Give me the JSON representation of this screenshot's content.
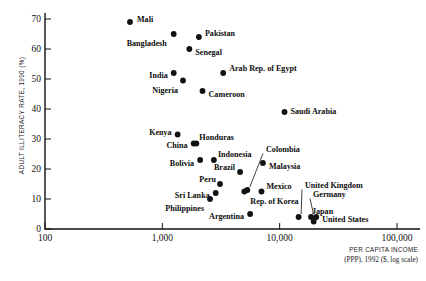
{
  "chart_data": {
    "type": "scatter",
    "title": "",
    "xlabel": "PER CAPITA INCOME",
    "xlabel2": "(PPP), 1992 ($, log scale)",
    "ylabel": "ADULT ILLITERACY RATE, 1990 (%)",
    "xscale": "log",
    "xlim": [
      100,
      100000
    ],
    "ylim": [
      0,
      72
    ],
    "grid": false,
    "legend": "none",
    "xticks": [
      100,
      1000,
      10000,
      100000
    ],
    "xtick_labels": [
      "100",
      "1,000",
      "10,000",
      "100,000"
    ],
    "yticks": [
      0,
      10,
      20,
      30,
      40,
      50,
      60,
      70
    ],
    "ytick_labels": [
      "0",
      "10",
      "20",
      "30",
      "40",
      "50",
      "60",
      "70"
    ],
    "points": [
      {
        "name": "Mali",
        "x": 530,
        "y": 69,
        "label_dx": 7,
        "label_dy": -3,
        "anchor": "start"
      },
      {
        "name": "Bangladesh",
        "x": 1250,
        "y": 65,
        "label_dx": -7,
        "label_dy": 9,
        "anchor": "end"
      },
      {
        "name": "Pakistan",
        "x": 2050,
        "y": 64,
        "label_dx": 6,
        "label_dy": -4,
        "anchor": "start"
      },
      {
        "name": "Senegal",
        "x": 1700,
        "y": 60,
        "label_dx": 6,
        "label_dy": 3,
        "anchor": "start"
      },
      {
        "name": "India",
        "x": 1250,
        "y": 52,
        "label_dx": -6,
        "label_dy": 2,
        "anchor": "end"
      },
      {
        "name": "Nigeria",
        "x": 1500,
        "y": 49.5,
        "label_dx": -5,
        "label_dy": 10,
        "anchor": "end"
      },
      {
        "name": "Cameroon",
        "x": 2200,
        "y": 46,
        "label_dx": 6,
        "label_dy": 3,
        "anchor": "start"
      },
      {
        "name": "Arab Rep. of Egypt",
        "x": 3300,
        "y": 52,
        "label_dx": 6,
        "label_dy": -5,
        "anchor": "start"
      },
      {
        "name": "Saudi Arabia",
        "x": 11000,
        "y": 39,
        "label_dx": 6,
        "label_dy": -1,
        "anchor": "start"
      },
      {
        "name": "Kenya",
        "x": 1350,
        "y": 31.5,
        "label_dx": -6,
        "label_dy": -2,
        "anchor": "end"
      },
      {
        "name": "China",
        "x": 1850,
        "y": 28.5,
        "label_dx": -6,
        "label_dy": 2,
        "anchor": "end"
      },
      {
        "name": "Honduras",
        "x": 1950,
        "y": 28.5,
        "label_dx": 3,
        "label_dy": -6,
        "anchor": "start"
      },
      {
        "name": "Indonesia",
        "x": 2750,
        "y": 23,
        "label_dx": 4,
        "label_dy": -6,
        "anchor": "start"
      },
      {
        "name": "Bolivia",
        "x": 2100,
        "y": 23,
        "label_dx": -6,
        "label_dy": 3,
        "anchor": "end"
      },
      {
        "name": "Brazil",
        "x": 4600,
        "y": 19,
        "label_dx": -5,
        "label_dy": -5,
        "anchor": "end"
      },
      {
        "name": "Colombia",
        "x": 5300,
        "y": 13,
        "label_dx": 0,
        "label_dy": 0,
        "anchor": "start",
        "leader": true
      },
      {
        "name": "Malaysia",
        "x": 7200,
        "y": 22,
        "label_dx": 6,
        "label_dy": 3,
        "anchor": "start"
      },
      {
        "name": "Peru",
        "x": 3100,
        "y": 15,
        "label_dx": -4,
        "label_dy": -5,
        "anchor": "end"
      },
      {
        "name": "Sri Lanka",
        "x": 2850,
        "y": 12,
        "label_dx": -6,
        "label_dy": 2,
        "anchor": "end"
      },
      {
        "name": "Philippines",
        "x": 2550,
        "y": 10,
        "label_dx": -6,
        "label_dy": 9,
        "anchor": "end"
      },
      {
        "name": "Mexico",
        "x": 7000,
        "y": 12.5,
        "label_dx": 5,
        "label_dy": -5,
        "anchor": "start"
      },
      {
        "name": "Rep. of Korea",
        "x": 5000,
        "y": 12.5,
        "label_dx": 6,
        "label_dy": 10,
        "anchor": "start"
      },
      {
        "name": "Argentina",
        "x": 5600,
        "y": 5,
        "label_dx": -6,
        "label_dy": 2,
        "anchor": "end"
      },
      {
        "name": "United Kingdom",
        "x": 14500,
        "y": 4,
        "label_dx": 0,
        "label_dy": 0,
        "anchor": "start",
        "leader": true
      },
      {
        "name": "Germany",
        "x": 18500,
        "y": 4,
        "label_dx": 0,
        "label_dy": 0,
        "anchor": "start",
        "leader": true
      },
      {
        "name": "United States",
        "x": 20500,
        "y": 4,
        "label_dx": 6,
        "label_dy": 2,
        "anchor": "start"
      },
      {
        "name": "Japan",
        "x": 19500,
        "y": 2.5,
        "label_dx": 0,
        "label_dy": 0,
        "anchor": "start",
        "leader": true
      }
    ]
  }
}
